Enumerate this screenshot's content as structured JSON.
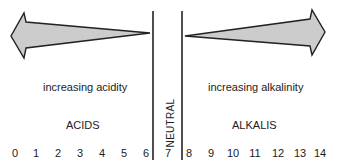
{
  "diagram": {
    "left_region": {
      "caption": "increasing acidity",
      "label": "ACIDS"
    },
    "center_region": {
      "label": "NEUTRAL"
    },
    "right_region": {
      "caption": "increasing alkalinity",
      "label": "ALKALIS"
    },
    "scale": [
      "0",
      "1",
      "2",
      "3",
      "4",
      "5",
      "6",
      "7",
      "8",
      "9",
      "10",
      "11",
      "12",
      "13",
      "14"
    ],
    "colors": {
      "arrow_fill": "#cccccc",
      "line": "#222222",
      "text": "#222222"
    }
  }
}
